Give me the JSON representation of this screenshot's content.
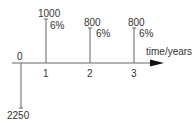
{
  "diagram": {
    "type": "cash-flow",
    "axis_label": "time/years",
    "time_points": [
      {
        "label": "0",
        "amount": "2250",
        "direction": "down",
        "rate": ""
      },
      {
        "label": "1",
        "amount": "1000",
        "direction": "up",
        "rate": "6%"
      },
      {
        "label": "2",
        "amount": "800",
        "direction": "up",
        "rate": "6%"
      },
      {
        "label": "3",
        "amount": "800",
        "direction": "up",
        "rate": "6%"
      }
    ],
    "colors": {
      "line": "#555555",
      "text": "#333333",
      "arrow": "#111111"
    }
  }
}
